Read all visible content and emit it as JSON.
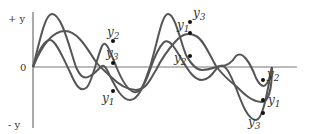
{
  "diagram": {
    "title": "",
    "axis": {
      "y_top_label": "+ y",
      "y_bottom_label": "- y",
      "origin_label": "0"
    },
    "curves": [
      {
        "name": "wave-a",
        "color": "#555555"
      },
      {
        "name": "wave-b",
        "color": "#555555"
      },
      {
        "name": "wave-c",
        "color": "#555555"
      }
    ],
    "point_groups": [
      {
        "position": "first",
        "labels": [
          {
            "text": "y2",
            "base": "y",
            "sub": "2",
            "x": 105,
            "y": 38
          },
          {
            "text": "y3",
            "base": "y",
            "sub": "3",
            "x": 105,
            "y": 55
          },
          {
            "text": "y1",
            "base": "y",
            "sub": "1",
            "x": 106,
            "y": 101
          }
        ]
      },
      {
        "position": "second",
        "labels": [
          {
            "text": "y3",
            "base": "y",
            "sub": "3",
            "x": 191,
            "y": 17
          },
          {
            "text": "y1",
            "base": "y",
            "sub": "1",
            "x": 176,
            "y": 29
          },
          {
            "text": "y2",
            "base": "y",
            "sub": "2",
            "x": 174,
            "y": 62
          }
        ]
      },
      {
        "position": "third",
        "labels": [
          {
            "text": "y2",
            "base": "y",
            "sub": "2",
            "x": 266,
            "y": 78
          },
          {
            "text": "y1",
            "base": "y",
            "sub": "1",
            "x": 268,
            "y": 106
          },
          {
            "text": "y3",
            "base": "y",
            "sub": "3",
            "x": 250,
            "y": 126
          }
        ]
      }
    ]
  }
}
